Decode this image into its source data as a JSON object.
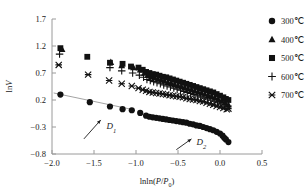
{
  "chart_data": {
    "type": "scatter",
    "title": "",
    "xlabel": "lnln(P/P0)",
    "ylabel": "lnV",
    "xlabel_parts": {
      "pre": "lnln(",
      "italic1": "P",
      "slash": "/",
      "italic2": "P",
      "sub": "0",
      "post": ")"
    },
    "ylabel_parts": {
      "pre": "ln",
      "italic": "V"
    },
    "xlim": [
      -2.0,
      0.5
    ],
    "ylim": [
      -0.8,
      1.7
    ],
    "xticks": [
      -2.0,
      -1.5,
      -1.0,
      -0.5,
      0.0,
      0.5
    ],
    "xticklabels": [
      "-2.0",
      "-1.5",
      "-1.0",
      "-0.5",
      "0.0",
      "0.5"
    ],
    "yticks": [
      -0.8,
      -0.3,
      0.2,
      0.7,
      1.2,
      1.7
    ],
    "yticklabels": [
      "-0.8",
      "-0.3",
      "0.2",
      "0.7",
      "1.2",
      "1.7"
    ],
    "grid": false,
    "legend_position": "outside-right-top",
    "annotations": [
      {
        "text": "D",
        "sub": "1",
        "x": -1.35,
        "y": -0.34,
        "arrow_from": [
          -1.62,
          -0.52
        ],
        "arrow_to": [
          -1.42,
          -0.17
        ]
      },
      {
        "text": "D",
        "sub": "2",
        "x": -0.28,
        "y": -0.63,
        "arrow_from": [
          -0.52,
          -0.72
        ],
        "arrow_to": [
          -0.34,
          -0.52
        ]
      }
    ],
    "fit_lines": [
      {
        "name": "D1-fit",
        "x": [
          -1.98,
          -1.03
        ],
        "y": [
          0.33,
          0.02
        ],
        "color": "#8c8c8c"
      }
    ],
    "series": [
      {
        "name": "300°C",
        "marker": "circle",
        "color": "#111111",
        "points": [
          [
            -1.9,
            0.3
          ],
          [
            -1.55,
            0.16
          ],
          [
            -1.31,
            0.08
          ],
          [
            -1.16,
            0.03
          ],
          [
            -1.05,
            0.01
          ],
          [
            -0.95,
            -0.04
          ],
          [
            -0.88,
            -0.09
          ],
          [
            -0.84,
            -0.11
          ],
          [
            -0.8,
            -0.12
          ],
          [
            -0.76,
            -0.13
          ],
          [
            -0.72,
            -0.14
          ],
          [
            -0.68,
            -0.15
          ],
          [
            -0.64,
            -0.16
          ],
          [
            -0.6,
            -0.17
          ],
          [
            -0.56,
            -0.18
          ],
          [
            -0.52,
            -0.19
          ],
          [
            -0.48,
            -0.2
          ],
          [
            -0.44,
            -0.21
          ],
          [
            -0.4,
            -0.22
          ],
          [
            -0.36,
            -0.24
          ],
          [
            -0.32,
            -0.25
          ],
          [
            -0.28,
            -0.27
          ],
          [
            -0.24,
            -0.28
          ],
          [
            -0.2,
            -0.3
          ],
          [
            -0.16,
            -0.32
          ],
          [
            -0.12,
            -0.34
          ],
          [
            -0.08,
            -0.36
          ],
          [
            -0.04,
            -0.39
          ],
          [
            0.0,
            -0.42
          ],
          [
            0.03,
            -0.46
          ],
          [
            0.05,
            -0.5
          ],
          [
            0.07,
            -0.53
          ],
          [
            0.1,
            -0.58
          ]
        ]
      },
      {
        "name": "400°C",
        "marker": "triangle",
        "color": "#111111",
        "points": [
          [
            -1.88,
            1.14
          ],
          [
            -1.3,
            0.9
          ],
          [
            -1.17,
            0.84
          ],
          [
            -1.03,
            0.8
          ],
          [
            -0.95,
            0.76
          ],
          [
            -0.9,
            0.7
          ],
          [
            -0.86,
            0.66
          ],
          [
            -0.82,
            0.63
          ],
          [
            -0.78,
            0.61
          ],
          [
            -0.74,
            0.59
          ],
          [
            -0.7,
            0.57
          ],
          [
            -0.66,
            0.55
          ],
          [
            -0.62,
            0.53
          ],
          [
            -0.58,
            0.51
          ],
          [
            -0.54,
            0.49
          ],
          [
            -0.5,
            0.47
          ],
          [
            -0.46,
            0.45
          ],
          [
            -0.42,
            0.43
          ],
          [
            -0.38,
            0.41
          ],
          [
            -0.34,
            0.39
          ],
          [
            -0.3,
            0.37
          ],
          [
            -0.26,
            0.35
          ],
          [
            -0.22,
            0.33
          ],
          [
            -0.18,
            0.31
          ],
          [
            -0.14,
            0.29
          ],
          [
            -0.1,
            0.27
          ],
          [
            -0.06,
            0.24
          ],
          [
            -0.02,
            0.21
          ],
          [
            0.02,
            0.18
          ],
          [
            0.06,
            0.15
          ],
          [
            0.1,
            0.11
          ]
        ]
      },
      {
        "name": "500°C",
        "marker": "square",
        "color": "#111111",
        "points": [
          [
            -1.9,
            1.16
          ],
          [
            -1.58,
            1.0
          ],
          [
            -1.31,
            0.89
          ],
          [
            -1.16,
            0.87
          ],
          [
            -1.06,
            0.82
          ],
          [
            -0.97,
            0.8
          ],
          [
            -0.92,
            0.76
          ],
          [
            -0.88,
            0.72
          ],
          [
            -0.84,
            0.7
          ],
          [
            -0.8,
            0.68
          ],
          [
            -0.76,
            0.67
          ],
          [
            -0.72,
            0.65
          ],
          [
            -0.68,
            0.63
          ],
          [
            -0.64,
            0.62
          ],
          [
            -0.6,
            0.6
          ],
          [
            -0.56,
            0.58
          ],
          [
            -0.52,
            0.56
          ],
          [
            -0.48,
            0.54
          ],
          [
            -0.44,
            0.52
          ],
          [
            -0.4,
            0.5
          ],
          [
            -0.36,
            0.48
          ],
          [
            -0.32,
            0.46
          ],
          [
            -0.28,
            0.44
          ],
          [
            -0.24,
            0.42
          ],
          [
            -0.2,
            0.4
          ],
          [
            -0.16,
            0.38
          ],
          [
            -0.12,
            0.36
          ],
          [
            -0.08,
            0.34
          ],
          [
            -0.04,
            0.31
          ],
          [
            0.0,
            0.28
          ],
          [
            0.04,
            0.25
          ],
          [
            0.07,
            0.22
          ],
          [
            0.1,
            0.2
          ]
        ]
      },
      {
        "name": "600°C",
        "marker": "plus",
        "color": "#111111",
        "points": [
          [
            -1.91,
            1.05
          ],
          [
            -1.31,
            0.8
          ],
          [
            -1.17,
            0.74
          ],
          [
            -1.04,
            0.7
          ],
          [
            -0.96,
            0.66
          ],
          [
            -0.91,
            0.62
          ],
          [
            -0.87,
            0.58
          ],
          [
            -0.83,
            0.56
          ],
          [
            -0.79,
            0.54
          ],
          [
            -0.75,
            0.52
          ],
          [
            -0.71,
            0.5
          ],
          [
            -0.67,
            0.48
          ],
          [
            -0.63,
            0.46
          ],
          [
            -0.59,
            0.44
          ],
          [
            -0.55,
            0.42
          ],
          [
            -0.51,
            0.4
          ],
          [
            -0.47,
            0.38
          ],
          [
            -0.43,
            0.36
          ],
          [
            -0.39,
            0.34
          ],
          [
            -0.35,
            0.32
          ],
          [
            -0.31,
            0.3
          ],
          [
            -0.27,
            0.28
          ],
          [
            -0.23,
            0.26
          ],
          [
            -0.19,
            0.24
          ],
          [
            -0.15,
            0.22
          ],
          [
            -0.11,
            0.2
          ],
          [
            -0.07,
            0.18
          ],
          [
            -0.03,
            0.15
          ],
          [
            0.01,
            0.12
          ],
          [
            0.05,
            0.09
          ]
        ]
      },
      {
        "name": "700°C",
        "marker": "x",
        "color": "#111111",
        "points": [
          [
            -1.92,
            0.85
          ],
          [
            -1.57,
            0.67
          ],
          [
            -1.32,
            0.56
          ],
          [
            -1.17,
            0.5
          ],
          [
            -1.05,
            0.46
          ],
          [
            -0.97,
            0.42
          ],
          [
            -0.92,
            0.39
          ],
          [
            -0.88,
            0.37
          ],
          [
            -0.84,
            0.35
          ],
          [
            -0.8,
            0.34
          ],
          [
            -0.76,
            0.33
          ],
          [
            -0.72,
            0.32
          ],
          [
            -0.68,
            0.31
          ],
          [
            -0.64,
            0.3
          ],
          [
            -0.6,
            0.29
          ],
          [
            -0.56,
            0.28
          ],
          [
            -0.52,
            0.27
          ],
          [
            -0.48,
            0.26
          ],
          [
            -0.44,
            0.25
          ],
          [
            -0.4,
            0.23
          ],
          [
            -0.36,
            0.22
          ],
          [
            -0.32,
            0.21
          ],
          [
            -0.28,
            0.2
          ],
          [
            -0.24,
            0.18
          ],
          [
            -0.2,
            0.17
          ],
          [
            -0.16,
            0.15
          ],
          [
            -0.12,
            0.13
          ],
          [
            -0.08,
            0.11
          ],
          [
            -0.04,
            0.09
          ],
          [
            0.0,
            0.07
          ],
          [
            0.04,
            0.05
          ],
          [
            0.08,
            0.03
          ],
          [
            0.1,
            0.04
          ]
        ]
      }
    ]
  },
  "legend": {
    "entries": [
      {
        "label": "300℃",
        "marker": "circle"
      },
      {
        "label": "400℃",
        "marker": "triangle"
      },
      {
        "label": "500℃",
        "marker": "square"
      },
      {
        "label": "600℃",
        "marker": "plus"
      },
      {
        "label": "700℃",
        "marker": "x"
      }
    ]
  }
}
